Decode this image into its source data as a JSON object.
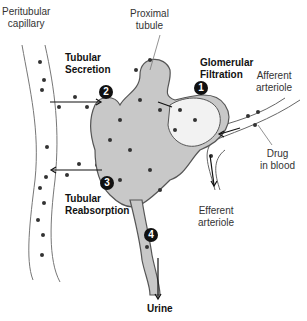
{
  "labels": {
    "peritubular_capillary": [
      "Peritubular",
      "capillary"
    ],
    "proximal_tubule": [
      "Proximal",
      "tubule"
    ],
    "tubular_secretion": [
      "Tubular",
      "Secretion"
    ],
    "glomerular_filtration": [
      "Glomerular",
      "Filtration"
    ],
    "afferent_arteriole": [
      "Afferent",
      "arteriole"
    ],
    "drug_in_blood": [
      "Drug",
      "in blood"
    ],
    "efferent_arteriole": [
      "Efferent",
      "arteriole"
    ],
    "tubular_reabsorption": [
      "Tubular",
      "Reabsorption"
    ],
    "urine": "Urine"
  },
  "steps": [
    {
      "number": "1",
      "process": "Glomerular Filtration"
    },
    {
      "number": "2",
      "process": "Tubular Secretion"
    },
    {
      "number": "3",
      "process": "Tubular Reabsorption"
    },
    {
      "number": "4",
      "process": "Excretion to urine"
    }
  ],
  "colors": {
    "tubule_fill": "#c8c8c8",
    "tubule_stroke": "#555555",
    "vessel_stroke": "#666666",
    "dot": "#333333",
    "badge": "#111111"
  }
}
